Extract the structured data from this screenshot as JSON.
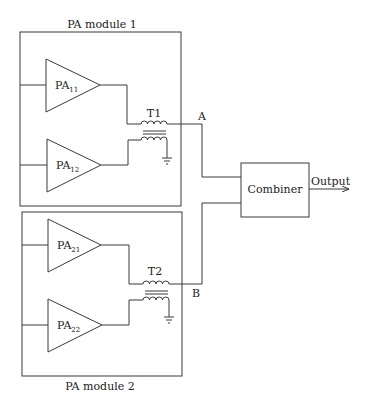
{
  "diagram": {
    "modules": [
      {
        "label": "PA module 1",
        "amplifiers": [
          {
            "name": "PA",
            "sub": "11"
          },
          {
            "name": "PA",
            "sub": "12"
          }
        ],
        "transformer": "T1",
        "output_node": "A"
      },
      {
        "label": "PA module 2",
        "amplifiers": [
          {
            "name": "PA",
            "sub": "21"
          },
          {
            "name": "PA",
            "sub": "22"
          }
        ],
        "transformer": "T2",
        "output_node": "B"
      }
    ],
    "combiner": {
      "label": "Combiner"
    },
    "output": {
      "label": "Output"
    }
  },
  "colors": {
    "line": "#3a3a3a",
    "text": "#222222",
    "background": "#ffffff"
  }
}
